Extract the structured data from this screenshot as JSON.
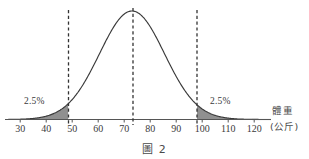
{
  "figure": {
    "caption": "圖 2",
    "top_cropped_text": "",
    "axis_title": "體重",
    "axis_unit": "(公斤)"
  },
  "labels": {
    "left_tail_pct": "2.5%",
    "right_tail_pct": "2.5%"
  },
  "colors": {
    "curve": "#3a3a3a",
    "axis": "#555555",
    "shade_fill": "#8a8a8a",
    "dashed_line": "#333333",
    "text": "#3a3a3a",
    "background": "#ffffff"
  },
  "chart_data": {
    "type": "line",
    "title": "",
    "subtitle": "",
    "xlabel": "體重 (公斤)",
    "ylabel": "",
    "xlim": [
      25,
      125
    ],
    "ylim": [
      0,
      1
    ],
    "grid": false,
    "legend": "none",
    "distribution": {
      "shape": "normal",
      "mean": 73,
      "std": 12.5,
      "peak_x": 73
    },
    "xticks": [
      30,
      40,
      50,
      60,
      70,
      80,
      90,
      100,
      110,
      120
    ],
    "xtick_labels": [
      "30",
      "40",
      "50",
      "60",
      "70",
      "80",
      "90",
      "100",
      "110",
      "120"
    ],
    "vertical_lines": [
      {
        "name": "lower-bound",
        "x": 48.5,
        "style": "dashed"
      },
      {
        "name": "mean",
        "x": 73,
        "style": "dashed"
      },
      {
        "name": "upper-bound",
        "x": 97.5,
        "style": "dashed"
      }
    ],
    "shaded_regions": [
      {
        "name": "left-tail",
        "from": 25,
        "to": 48.5,
        "label": "2.5%",
        "area": 0.025
      },
      {
        "name": "right-tail",
        "from": 97.5,
        "to": 125,
        "label": "2.5%",
        "area": 0.025
      }
    ],
    "annotations": [
      {
        "text": "2.5%",
        "x": 38,
        "position": "above-left-tail"
      },
      {
        "text": "2.5%",
        "x": 108,
        "position": "above-right-tail"
      }
    ]
  }
}
